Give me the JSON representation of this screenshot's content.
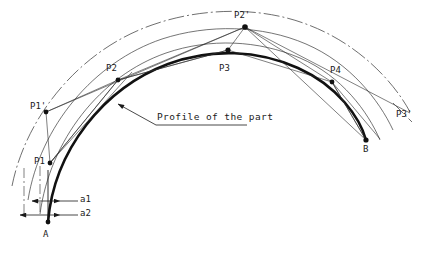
{
  "figure": {
    "type": "engineering-drawing",
    "title_text": "",
    "background_color": "#ffffff",
    "ink_color": "#1a1a1a",
    "profile_color": "#111111",
    "construction_color": "#555555"
  },
  "annotation": {
    "profile_note": "Profile of the part"
  },
  "labels": {
    "p1_prime": "P1'",
    "p1": "P1",
    "p2": "P2",
    "p2_prime": "P2'",
    "p3": "P3",
    "p3_prime": "P3'",
    "p4": "P4",
    "a1": "a1",
    "a2": "a2",
    "a": "A",
    "b": "B"
  },
  "points": [
    {
      "name": "P1'",
      "x": 46,
      "y": 112,
      "kind": "offset-node"
    },
    {
      "name": "P1",
      "x": 50,
      "y": 163,
      "kind": "profile-node"
    },
    {
      "name": "P2",
      "x": 118,
      "y": 80,
      "kind": "profile-node"
    },
    {
      "name": "P2'",
      "x": 245,
      "y": 27,
      "kind": "offset-node"
    },
    {
      "name": "P3",
      "x": 228,
      "y": 50,
      "kind": "profile-node"
    },
    {
      "name": "P4",
      "x": 332,
      "y": 82,
      "kind": "profile-node"
    },
    {
      "name": "A",
      "x": 48,
      "y": 222,
      "kind": "endpoint"
    },
    {
      "name": "B",
      "x": 366,
      "y": 140,
      "kind": "endpoint"
    }
  ],
  "label_positions": {
    "p1_prime": {
      "x": 30,
      "y": 102
    },
    "p1": {
      "x": 34,
      "y": 162
    },
    "p2": {
      "x": 106,
      "y": 64
    },
    "p2_prime": {
      "x": 234,
      "y": 11
    },
    "p3": {
      "x": 219,
      "y": 65
    },
    "p3_prime": {
      "x": 396,
      "y": 112
    },
    "p4": {
      "x": 330,
      "y": 67
    },
    "a1": {
      "x": 68,
      "y": 196
    },
    "a2": {
      "x": 68,
      "y": 216
    },
    "a": {
      "x": 43,
      "y": 232
    },
    "b": {
      "x": 363,
      "y": 146
    },
    "note": {
      "x": 157,
      "y": 112
    }
  },
  "dimensions": [
    {
      "name": "a1",
      "y": 201,
      "from_x": 36,
      "to_x": 62,
      "arrow_style": "inward"
    },
    {
      "name": "a2",
      "y": 215,
      "from_x": 24,
      "to_x": 62,
      "arrow_style": "inward"
    }
  ],
  "leader": {
    "from_x": 118,
    "from_y": 105,
    "to_x": 155,
    "to_y": 124,
    "underline_to_x": 245
  }
}
